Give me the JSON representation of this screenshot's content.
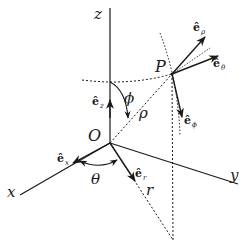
{
  "diagram": {
    "axes": {
      "x": "x",
      "y": "y",
      "z": "z"
    },
    "points": {
      "origin": "O",
      "point": "P"
    },
    "quantities": {
      "theta": "θ",
      "phi": "ϕ",
      "rho": "ρ",
      "r": "r"
    },
    "unit_vectors": {
      "e_x": {
        "base": "ê",
        "sub": "x"
      },
      "e_z": {
        "base": "ê",
        "sub": "z"
      },
      "e_r": {
        "base": "ê",
        "sub": "r"
      },
      "e_rho": {
        "base": "ê",
        "sub": "ρ"
      },
      "e_theta": {
        "base": "ê",
        "sub": "θ"
      },
      "e_phi": {
        "base": "ê",
        "sub": "ϕ"
      }
    },
    "colors": {
      "ink": "#1a1a1a",
      "background": "#ffffff"
    }
  }
}
